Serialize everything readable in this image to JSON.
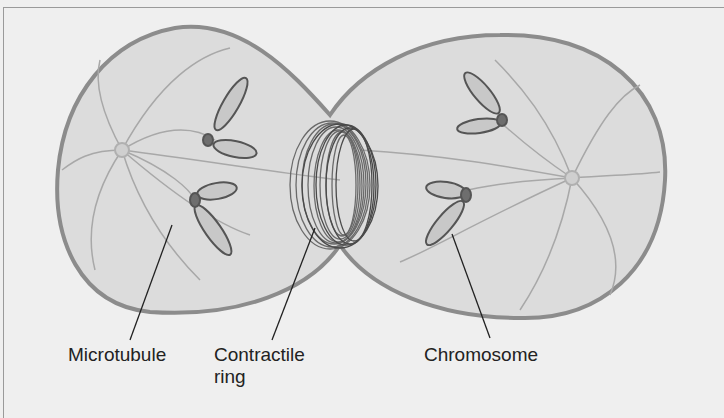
{
  "diagram": {
    "labels": {
      "microtubule": "Microtubule",
      "contractile_ring_line1": "Contractile",
      "contractile_ring_line2": "ring",
      "chromosome": "Chromosome"
    },
    "colors": {
      "background": "#efefef",
      "cell_fill": "#dcdcdc",
      "cell_outline": "#8c8c8c",
      "ring": "#6a6a6a",
      "chromosome_fill": "#c8c8c8",
      "centromere": "#6e6e6e"
    }
  }
}
